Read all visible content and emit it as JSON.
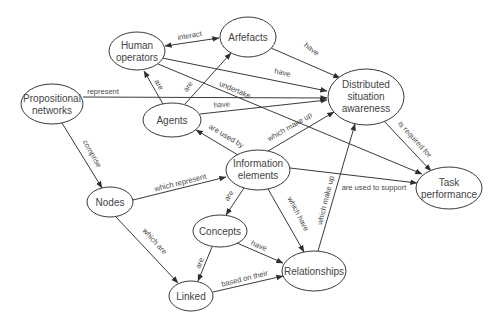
{
  "diagram": {
    "type": "concept-map",
    "colors": {
      "background": "#ffffff",
      "stroke": "#3a3a3a",
      "text": "#444444"
    },
    "nodes": {
      "human_operators": {
        "lines": [
          "Human",
          "operators"
        ]
      },
      "arfefacts": {
        "lines": [
          "Arfefacts"
        ]
      },
      "propositional_networks": {
        "lines": [
          "Propositional",
          "networks"
        ]
      },
      "agents": {
        "lines": [
          "Agents"
        ]
      },
      "distributed_situation_awareness": {
        "lines": [
          "Distributed",
          "situation",
          "awareness"
        ]
      },
      "information_elements": {
        "lines": [
          "Information",
          "elements"
        ]
      },
      "task_performance": {
        "lines": [
          "Task",
          "performance"
        ]
      },
      "nodes": {
        "lines": [
          "Nodes"
        ]
      },
      "concepts": {
        "lines": [
          "Concepts"
        ]
      },
      "linked": {
        "lines": [
          "Linked"
        ]
      },
      "relationships": {
        "lines": [
          "Relationships"
        ]
      }
    },
    "edges": [
      {
        "from": "Human operators",
        "to": "Arfefacts",
        "label": "interact",
        "bidirectional": true
      },
      {
        "from": "Arfefacts",
        "to": "Distributed situation awareness",
        "label": "have"
      },
      {
        "from": "Human operators",
        "to": "Distributed situation awareness",
        "label": "have"
      },
      {
        "from": "Human operators",
        "to": "Task performance",
        "label": "undertake"
      },
      {
        "from": "Propositional networks",
        "to": "Distributed situation awareness",
        "label": "represent"
      },
      {
        "from": "Agents",
        "to": "Human operators",
        "label": "are"
      },
      {
        "from": "Agents",
        "to": "Arfefacts",
        "label": "are"
      },
      {
        "from": "Agents",
        "to": "Distributed situation awareness",
        "label": "have"
      },
      {
        "from": "Information elements",
        "to": "Agents",
        "label": "are used by"
      },
      {
        "from": "Information elements",
        "to": "Distributed situation awareness",
        "label": "which make up"
      },
      {
        "from": "Propositional networks",
        "to": "Nodes",
        "label": "comprise"
      },
      {
        "from": "Nodes",
        "to": "Information elements",
        "label": "which represent"
      },
      {
        "from": "Information elements",
        "to": "Task performance",
        "label": "are used to support"
      },
      {
        "from": "Information elements",
        "to": "Concepts",
        "label": "are"
      },
      {
        "from": "Information elements",
        "to": "Relationships",
        "label": "which have"
      },
      {
        "from": "Relationships",
        "to": "Distributed situation awareness",
        "label": "which make up"
      },
      {
        "from": "Concepts",
        "to": "Relationships",
        "label": "have"
      },
      {
        "from": "Concepts",
        "to": "Linked",
        "label": "are"
      },
      {
        "from": "Nodes",
        "to": "Linked",
        "label": "which are"
      },
      {
        "from": "Linked",
        "to": "Relationships",
        "label": "based on their"
      },
      {
        "from": "Distributed situation awareness",
        "to": "Task performance",
        "label": "is required for"
      }
    ]
  }
}
